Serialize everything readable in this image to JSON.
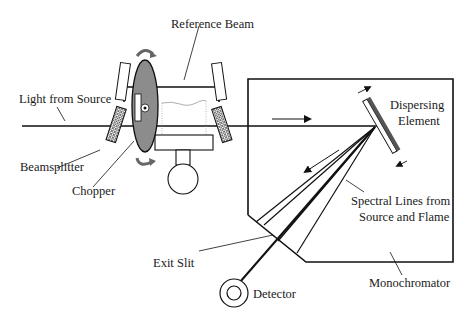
{
  "labels": {
    "reference_beam": "Reference Beam",
    "light_from_source": "Light from Source",
    "beamsplitter": "Beamsplitter",
    "chopper": "Chopper",
    "dispersing_element_line1": "Dispersing",
    "dispersing_element_line2": "Element",
    "spectral_lines_line1": "Spectral Lines from",
    "spectral_lines_line2": "Source and Flame",
    "exit_slit": "Exit Slit",
    "detector": "Detector",
    "monochromator": "Monochromator"
  },
  "colors": {
    "line": "#111111",
    "chopper_fill": "#8c8c8c",
    "mirror_dark": "#555555"
  }
}
